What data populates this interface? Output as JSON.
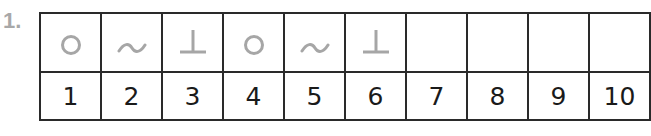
{
  "problem": {
    "number": "1."
  },
  "pattern_table": {
    "symbols": [
      {
        "index": 1,
        "symbol": "circle-icon"
      },
      {
        "index": 2,
        "symbol": "tilde-icon"
      },
      {
        "index": 3,
        "symbol": "perpendicular-icon"
      },
      {
        "index": 4,
        "symbol": "circle-icon"
      },
      {
        "index": 5,
        "symbol": "tilde-icon"
      },
      {
        "index": 6,
        "symbol": "perpendicular-icon"
      },
      {
        "index": 7,
        "symbol": ""
      },
      {
        "index": 8,
        "symbol": ""
      },
      {
        "index": 9,
        "symbol": ""
      },
      {
        "index": 10,
        "symbol": ""
      }
    ],
    "numbers": [
      "1",
      "2",
      "3",
      "4",
      "5",
      "6",
      "7",
      "8",
      "9",
      "10"
    ]
  },
  "colors": {
    "symbol": "#a6a6a6",
    "grid": "#2a2a2a",
    "number_text": "#1a1a1a",
    "problem_number": "#a8a8a8"
  }
}
